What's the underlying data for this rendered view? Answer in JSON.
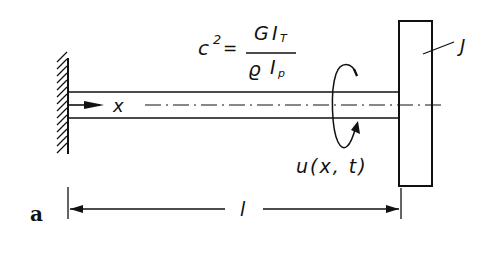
{
  "diagram": {
    "panel_label": "a",
    "formula": {
      "lhs": "c",
      "lhs_exponent": "2",
      "equals": "=",
      "numerator_symbol": "G",
      "numerator_I": "I",
      "numerator_sub": "T",
      "denominator_symbol": "ϱ",
      "denominator_I": "I",
      "denominator_sub": "p"
    },
    "axis_label": "x",
    "displacement_label": "u(x, t)",
    "disk_label": "J",
    "length_label": "l",
    "colors": {
      "ink": "#111111",
      "background": "#ffffff"
    }
  }
}
